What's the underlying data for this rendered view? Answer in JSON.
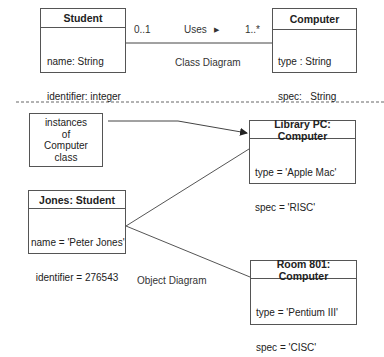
{
  "class_diagram": {
    "caption": "Class Diagram",
    "student_class": {
      "name": "Student",
      "attributes": [
        "name: String",
        "identifier: integer"
      ]
    },
    "computer_class": {
      "name": "Computer",
      "attributes": [
        "type : String",
        "spec:   String"
      ]
    },
    "association": {
      "label": "Uses",
      "direction_icon": "triangle-right",
      "source_multiplicity": "0..1",
      "target_multiplicity": "1..*"
    }
  },
  "object_diagram": {
    "caption": "Object Diagram",
    "note": {
      "lines": [
        "instances",
        "of",
        "Computer",
        "class"
      ]
    },
    "jones": {
      "name": "Jones: Student",
      "attributes": [
        "name = 'Peter Jones'",
        "identifier = 276543"
      ]
    },
    "library_pc": {
      "name": "Library PC: Computer",
      "attributes": [
        "type = 'Apple Mac'",
        "spec = 'RISC'"
      ]
    },
    "room_801": {
      "name": "Room 801: Computer",
      "attributes": [
        "type = 'Pentium III'",
        "spec = 'CISC'"
      ]
    }
  }
}
